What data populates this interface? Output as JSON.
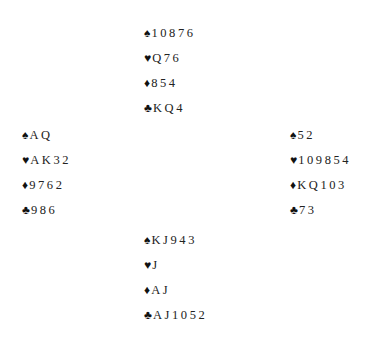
{
  "suits": {
    "spades": "♠",
    "hearts": "♥",
    "diamonds": "♦",
    "clubs": "♣"
  },
  "hands": {
    "north": {
      "spades": "10876",
      "hearts": "Q76",
      "diamonds": "854",
      "clubs": "KQ4"
    },
    "west": {
      "spades": "AQ",
      "hearts": "AK32",
      "diamonds": "9762",
      "clubs": "986"
    },
    "east": {
      "spades": "52",
      "hearts": "109854",
      "diamonds": "KQ103",
      "clubs": "73"
    },
    "south": {
      "spades": "KJ943",
      "hearts": "J",
      "diamonds": "AJ",
      "clubs": "AJ1052"
    }
  }
}
